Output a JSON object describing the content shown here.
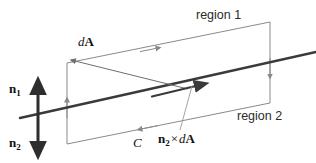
{
  "figure": {
    "name": "boundary-surface-circulation-diagram",
    "labels": {
      "region1": "region 1",
      "region2": "region 2",
      "dA_d": "d",
      "dA_A": "A",
      "n1_n": "n",
      "n1_sub": "1",
      "n2_n": "n",
      "n2_sub": "2",
      "contour": "C",
      "cross_n": "n",
      "cross_sub": "2",
      "cross_times": "×",
      "cross_d": "d",
      "cross_A": "A"
    },
    "colors": {
      "interface_line": "#3a3a3a",
      "loop_outline": "#8a8a8a",
      "normal_arrow": "#2e2e2e",
      "leader_line": "#9a9a9a",
      "text": "#1a1a1a",
      "background": "#ffffff"
    },
    "geometry": {
      "interface_line": {
        "x1": 20,
        "y1": 118,
        "x2": 316,
        "y2": 52
      },
      "loop_corners": [
        {
          "x": 67,
          "y": 63
        },
        {
          "x": 270,
          "y": 22
        },
        {
          "x": 270,
          "y": 103
        },
        {
          "x": 67,
          "y": 144
        }
      ],
      "normal_arrow": {
        "x": 38,
        "y1": 80,
        "y2": 154
      },
      "dA_arrow": {
        "x1": 185,
        "y1": 88,
        "x2": 71,
        "y2": 60
      },
      "tangent_arrow": {
        "x1": 152,
        "y1": 96,
        "x2": 206,
        "y2": 83
      }
    }
  }
}
